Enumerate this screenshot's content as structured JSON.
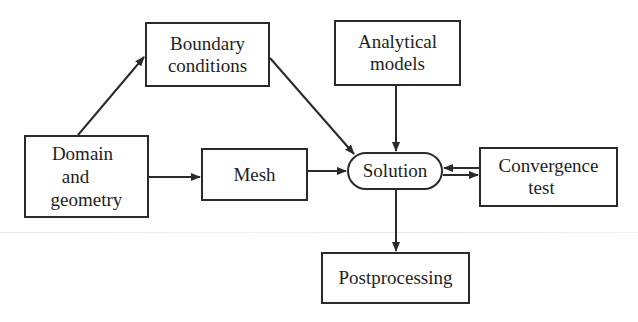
{
  "diagram": {
    "type": "flowchart",
    "nodes": [
      {
        "id": "boundary",
        "lines": [
          "Boundary",
          "conditions"
        ],
        "shape": "rect",
        "box": [
          145,
          22,
          125,
          65
        ]
      },
      {
        "id": "analytical",
        "lines": [
          "Analytical",
          "models"
        ],
        "shape": "rect",
        "box": [
          334,
          20,
          127,
          66
        ]
      },
      {
        "id": "domain",
        "lines": [
          "Domain",
          "and",
          "geometry"
        ],
        "shape": "rect",
        "box": [
          24,
          135,
          125,
          83
        ]
      },
      {
        "id": "mesh",
        "lines": [
          "Mesh"
        ],
        "shape": "rect",
        "box": [
          201,
          148,
          107,
          53
        ]
      },
      {
        "id": "solution",
        "lines": [
          "Solution"
        ],
        "shape": "pill",
        "box": [
          347,
          152,
          96,
          38
        ]
      },
      {
        "id": "convergence",
        "lines": [
          "Convergence",
          "test"
        ],
        "shape": "rect",
        "box": [
          479,
          147,
          139,
          60
        ]
      },
      {
        "id": "postprocessing",
        "lines": [
          "Postprocessing"
        ],
        "shape": "rect",
        "box": [
          321,
          252,
          149,
          52
        ]
      }
    ],
    "edges": [
      {
        "from": "domain",
        "to": "boundary"
      },
      {
        "from": "domain",
        "to": "mesh"
      },
      {
        "from": "mesh",
        "to": "solution"
      },
      {
        "from": "boundary",
        "to": "solution"
      },
      {
        "from": "analytical",
        "to": "solution"
      },
      {
        "from": "convergence",
        "to": "solution"
      },
      {
        "from": "solution",
        "to": "convergence"
      },
      {
        "from": "solution",
        "to": "postprocessing"
      }
    ],
    "colors": {
      "stroke": "#2a2a2a",
      "text": "#1e1e1e",
      "background": "#ffffff"
    }
  },
  "labels": {
    "boundary": {
      "l1": "Boundary",
      "l2": "conditions"
    },
    "analytical": {
      "l1": "Analytical",
      "l2": "models"
    },
    "domain": {
      "l1": "Domain",
      "l2": "and",
      "l3": "geometry"
    },
    "mesh": {
      "l1": "Mesh"
    },
    "solution": {
      "l1": "Solution"
    },
    "convergence": {
      "l1": "Convergence",
      "l2": "test"
    },
    "postprocessing": {
      "l1": "Postprocessing"
    }
  }
}
